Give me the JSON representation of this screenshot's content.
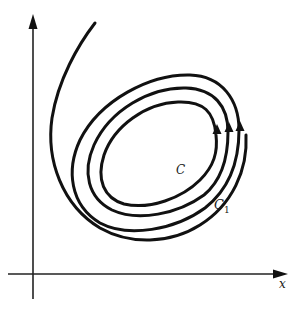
{
  "figure": {
    "axes": {
      "x_label": "x",
      "y_label": ""
    },
    "labels": {
      "inner_curve": "C",
      "outer_curve": "C",
      "outer_curve_subscript": "1"
    },
    "colors": {
      "stroke": "#111111",
      "background": "#ffffff"
    }
  }
}
